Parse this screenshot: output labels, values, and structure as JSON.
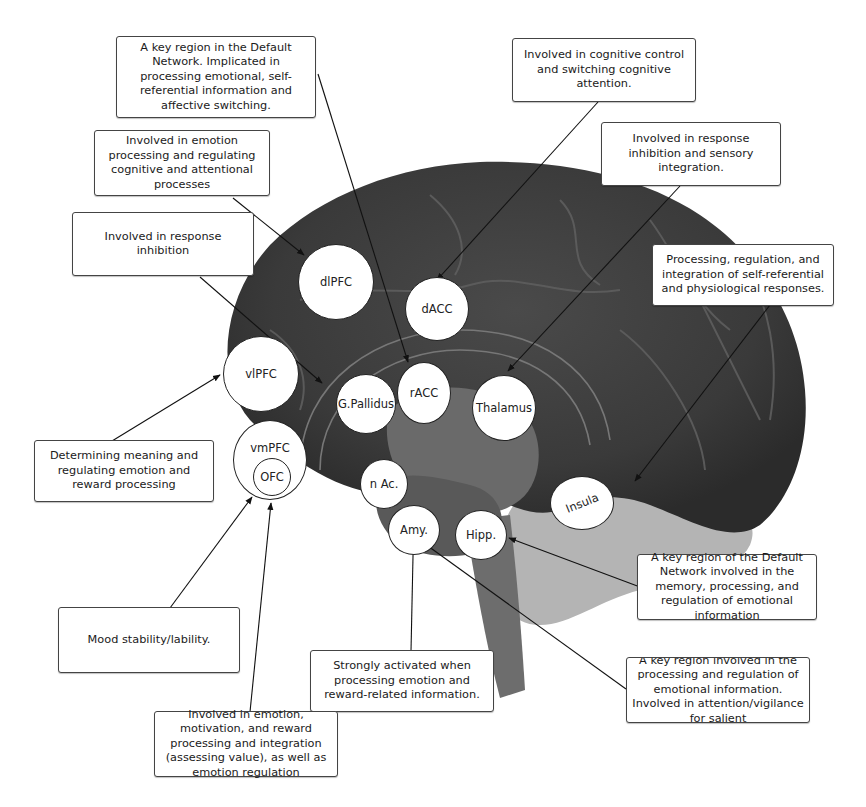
{
  "diagram": {
    "type": "annotated brain sagittal section",
    "regions": [
      {
        "id": "dlpfc",
        "label": "dlPFC"
      },
      {
        "id": "dacc",
        "label": "dACC"
      },
      {
        "id": "vlpfc",
        "label": "vlPFC"
      },
      {
        "id": "gpallidus",
        "label": "G.Pallidus"
      },
      {
        "id": "racc",
        "label": "rACC"
      },
      {
        "id": "thalamus",
        "label": "Thalamus"
      },
      {
        "id": "vmpfc",
        "label": "vmPFC"
      },
      {
        "id": "ofc",
        "label": "OFC"
      },
      {
        "id": "nac",
        "label": "n Ac."
      },
      {
        "id": "amy",
        "label": "Amy."
      },
      {
        "id": "hipp",
        "label": "Hipp."
      },
      {
        "id": "insula",
        "label": "Insula"
      }
    ],
    "annotations": {
      "racc": "A key region in the Default Network. Implicated in processing emotional, self-referential information and affective switching.",
      "dacc": "Involved in cognitive control and switching cognitive attention.",
      "dlpfc": "Involved in emotion processing and regulating cognitive and attentional processes",
      "thalamus": "Involved in response inhibition and sensory integration.",
      "gpallidus": "Involved in response inhibition",
      "insula": "Processing, regulation, and integration of self-referential and physiological responses.",
      "vlpfc": "Determining meaning and regulating emotion and reward processing",
      "hipp": "A key region of the Default Network involved in the memory, processing, and regulation of emotional information",
      "vmpfc": "Mood stability/lability.",
      "nac": "Strongly activated when processing emotion and reward-related information.",
      "amy": "A key region involved in the processing and regulation of emotional information. Involved in attention/vigilance for salient",
      "ofc": "Involved in emotion, motivation, and reward processing and integration (assessing value), as well as emotion regulation"
    }
  }
}
